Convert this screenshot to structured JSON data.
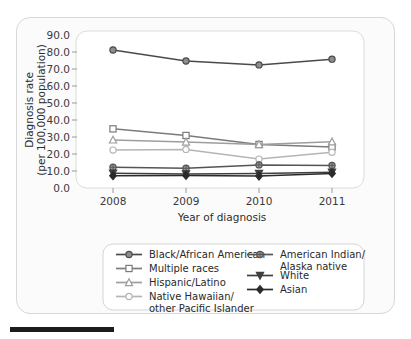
{
  "chart_data": {
    "type": "line",
    "title": "",
    "xlabel": "Year of diagnosis",
    "ylabel": "Diagnosis rate\n(per 100,000 population)",
    "ylabel_line1": "Diagnosis rate",
    "ylabel_line2": "(per 100,000 population)",
    "categories": [
      "2008",
      "2009",
      "2010",
      "2011"
    ],
    "x": [
      2008,
      2009,
      2010,
      2011
    ],
    "ylim": [
      0.0,
      90.0
    ],
    "ytick_step": 10.0,
    "yticks": [
      "0.0",
      "10.0",
      "20.0",
      "30.0",
      "40.0",
      "50.0",
      "60.0",
      "70.0",
      "80.0",
      "90.0"
    ],
    "ytick_values": [
      0.0,
      10.0,
      20.0,
      30.0,
      40.0,
      50.0,
      60.0,
      70.0,
      80.0,
      90.0
    ],
    "grid": false,
    "legend_position": "bottom",
    "series": [
      {
        "name": "Black/African American",
        "marker": "circle",
        "color": "#4a4a4a",
        "values": [
          81.2,
          74.7,
          72.4,
          75.8
        ]
      },
      {
        "name": "Multiple races",
        "marker": "square",
        "color": "#7b7b7b",
        "values": [
          34.8,
          30.9,
          25.6,
          24.1
        ]
      },
      {
        "name": "Hispanic/Latino",
        "marker": "triangle-up",
        "color": "#9e9e9e",
        "values": [
          28.3,
          27.1,
          25.6,
          27.2
        ]
      },
      {
        "name": "Native Hawaiian/other Pacific Islander",
        "marker": "circle-open",
        "color": "#b5b5b5",
        "values": [
          22.3,
          22.7,
          17.0,
          21.0
        ]
      },
      {
        "name": "American Indian/Alaska native",
        "marker": "circle-cross",
        "color": "#555555",
        "values": [
          12.2,
          11.6,
          13.6,
          13.3
        ]
      },
      {
        "name": "White",
        "marker": "triangle-down",
        "color": "#3f3f3f",
        "values": [
          8.7,
          8.3,
          8.6,
          9.3
        ]
      },
      {
        "name": "Asian",
        "marker": "diamond",
        "color": "#2b2b2b",
        "values": [
          7.2,
          7.4,
          7.0,
          8.6
        ]
      }
    ],
    "legend_entries": [
      {
        "label": "Black/African American",
        "marker": "circle",
        "color": "#4a4a4a"
      },
      {
        "label": "Multiple races",
        "marker": "square",
        "color": "#7b7b7b"
      },
      {
        "label": "Hispanic/Latino",
        "marker": "triangle-up",
        "color": "#9e9e9e"
      },
      {
        "label": "Native Hawaiian/",
        "label2": "other Pacific Islander",
        "marker": "circle-open",
        "color": "#b5b5b5"
      },
      {
        "label": "American Indian/",
        "label2": "Alaska native",
        "marker": "circle-cross",
        "color": "#555555"
      },
      {
        "label": "White",
        "marker": "triangle-down",
        "color": "#3f3f3f"
      },
      {
        "label": "Asian",
        "marker": "diamond",
        "color": "#2b2b2b"
      }
    ]
  },
  "axis": {
    "y_title_line1": "Diagnosis rate",
    "y_title_line2": "(per 100,000 population)",
    "x_title": "Year of diagnosis",
    "ytick_0": "0.0",
    "ytick_1": "10.0",
    "ytick_2": "20.0",
    "ytick_3": "30.0",
    "ytick_4": "40.0",
    "ytick_5": "50.0",
    "ytick_6": "60.0",
    "ytick_7": "70.0",
    "ytick_8": "80.0",
    "ytick_9": "90.0",
    "xtick_0": "2008",
    "xtick_1": "2009",
    "xtick_2": "2010",
    "xtick_3": "2011"
  },
  "legend": {
    "item_0": "Black/African American",
    "item_1": "Multiple races",
    "item_2": "Hispanic/Latino",
    "item_3a": "Native Hawaiian/",
    "item_3b": "other Pacific Islander",
    "item_4a": "American Indian/",
    "item_4b": "Alaska native",
    "item_5": "White",
    "item_6": "Asian"
  }
}
